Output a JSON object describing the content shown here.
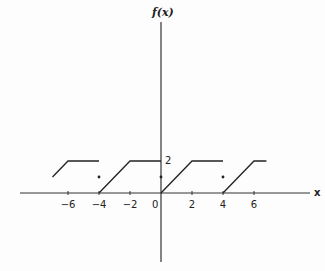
{
  "chart_data": {
    "type": "line",
    "title": "",
    "xlabel": "x",
    "ylabel": "f(x)",
    "x_ticks": [
      -6,
      -4,
      -2,
      0,
      2,
      4,
      6
    ],
    "x_tick_labels": [
      "−6",
      "−4",
      "−2",
      "0",
      "2",
      "4",
      "6"
    ],
    "y_ticks": [
      2
    ],
    "y_tick_labels": [
      "2"
    ],
    "xlim": [
      -10,
      7.5
    ],
    "ylim": [
      -5,
      11
    ],
    "grid": false,
    "legend": null,
    "period": 4,
    "segments": [
      {
        "x": [
          -7,
          -6,
          -4
        ],
        "y": [
          1,
          2,
          2
        ]
      },
      {
        "x": [
          -4,
          -2,
          0
        ],
        "y": [
          0,
          2,
          2
        ]
      },
      {
        "x": [
          0,
          2,
          4
        ],
        "y": [
          0,
          2,
          2
        ]
      },
      {
        "x": [
          4,
          6,
          6.8
        ],
        "y": [
          0,
          2,
          2
        ]
      }
    ],
    "points": [
      {
        "x": -4,
        "y": 1
      },
      {
        "x": 0,
        "y": 1
      },
      {
        "x": 4,
        "y": 1
      }
    ]
  },
  "labels": {
    "x_axis": "x",
    "y_axis": "f(x)"
  }
}
